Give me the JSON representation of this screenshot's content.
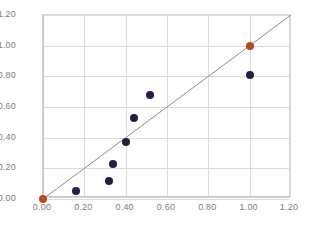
{
  "chart_data": {
    "type": "scatter",
    "title": "",
    "subtitle": "",
    "xlabel": "",
    "ylabel": "",
    "xlim": [
      0.0,
      1.2
    ],
    "ylim": [
      0.0,
      1.2
    ],
    "xticks": [
      "0.00",
      "0.20",
      "0.40",
      "0.60",
      "0.80",
      "1.00",
      "1.20"
    ],
    "yticks": [
      "0.00",
      "0.20",
      "0.40",
      "0.60",
      "0.80",
      "1.00",
      "1.20"
    ],
    "xtick_values": [
      0.0,
      0.2,
      0.4,
      0.6,
      0.8,
      1.0,
      1.2
    ],
    "ytick_values": [
      0.0,
      0.2,
      0.4,
      0.6,
      0.8,
      1.0,
      1.2
    ],
    "grid": true,
    "legend": "none",
    "reference_line": {
      "name": "identity-line",
      "from": [
        0.0,
        0.0
      ],
      "to": [
        1.2,
        1.2
      ],
      "slope": 1.0,
      "intercept": 0.0,
      "color": "#8c8c8c"
    },
    "series": [
      {
        "name": "data-points",
        "marker": "circle",
        "color": "#1f1f47",
        "points": [
          {
            "x": 0.16,
            "y": 0.05
          },
          {
            "x": 0.32,
            "y": 0.12
          },
          {
            "x": 0.34,
            "y": 0.23
          },
          {
            "x": 0.4,
            "y": 0.37
          },
          {
            "x": 0.44,
            "y": 0.53
          },
          {
            "x": 0.52,
            "y": 0.68
          },
          {
            "x": 1.0,
            "y": 0.81
          }
        ]
      },
      {
        "name": "highlighted-points",
        "marker": "circle",
        "color": "#b9491f",
        "points": [
          {
            "x": 0.0,
            "y": 0.0
          },
          {
            "x": 1.0,
            "y": 1.0
          }
        ]
      }
    ]
  }
}
